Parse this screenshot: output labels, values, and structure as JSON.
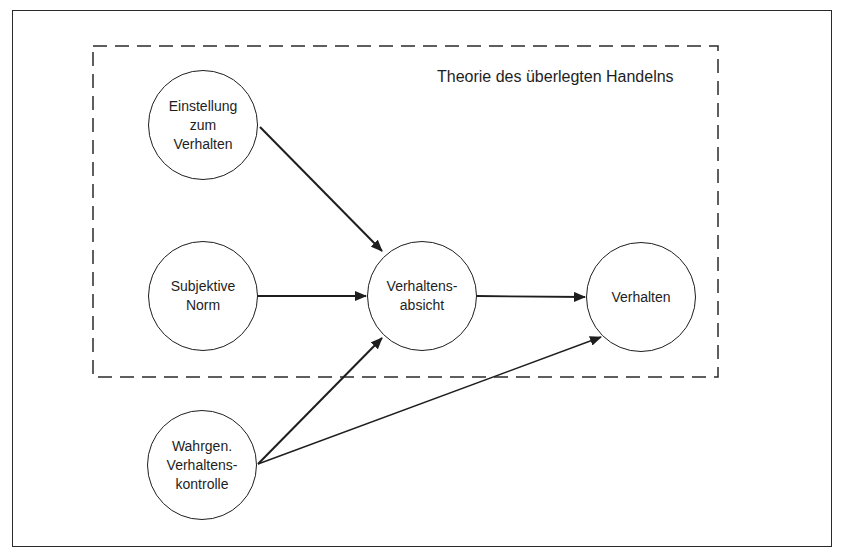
{
  "diagram": {
    "title": "Theorie des überlegten Handelns",
    "nodes": [
      {
        "id": "einstellung",
        "label": "Einstellung\nzum\nVerhalten",
        "cx": 203,
        "cy": 125
      },
      {
        "id": "subjektive_norm",
        "label": "Subjektive\nNorm",
        "cx": 203,
        "cy": 296
      },
      {
        "id": "verhaltensabsicht",
        "label": "Verhaltens-\nabsicht",
        "cx": 422,
        "cy": 296
      },
      {
        "id": "verhalten",
        "label": "Verhalten",
        "cx": 641,
        "cy": 297
      },
      {
        "id": "wahrgen_kontrolle",
        "label": "Wahrgen.\nVerhaltens-\nkontrolle",
        "cx": 202,
        "cy": 465
      }
    ],
    "edges": [
      {
        "from": "einstellung",
        "to": "verhaltensabsicht"
      },
      {
        "from": "subjektive_norm",
        "to": "verhaltensabsicht"
      },
      {
        "from": "verhaltensabsicht",
        "to": "verhalten"
      },
      {
        "from": "wahrgen_kontrolle",
        "to": "verhaltensabsicht"
      },
      {
        "from": "wahrgen_kontrolle",
        "to": "verhalten"
      }
    ],
    "group": {
      "label": "Theorie des überlegten Handelns",
      "style": "dashed",
      "contains": [
        "einstellung",
        "subjektive_norm",
        "verhaltensabsicht",
        "verhalten"
      ]
    },
    "colors": {
      "stroke": "#1e1e1e",
      "background": "#ffffff"
    }
  }
}
